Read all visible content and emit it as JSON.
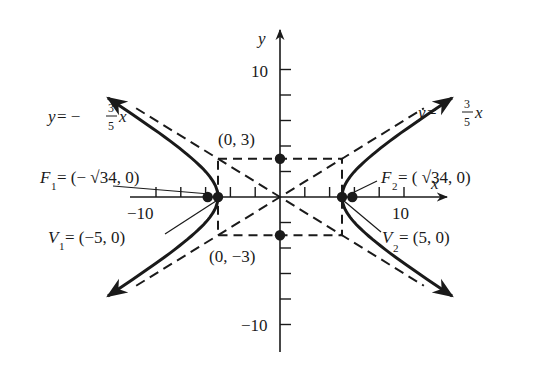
{
  "chart_data": {
    "type": "diagram",
    "xlabel": "x",
    "ylabel": "y",
    "xlim": [
      -12,
      12
    ],
    "ylim": [
      -12,
      12
    ],
    "x_tick_step": 2,
    "y_tick_step": 2,
    "x_tick_labels": [
      {
        "value": -10,
        "text": "−10"
      },
      {
        "value": 10,
        "text": "10"
      }
    ],
    "y_tick_labels": [
      {
        "value": 10,
        "text": "10"
      },
      {
        "value": -10,
        "text": "−10"
      }
    ],
    "hyperbola": {
      "a": 5,
      "b": 3,
      "center": [
        0,
        0
      ],
      "orientation": "horizontal"
    },
    "asymptotes": [
      {
        "slope": 0.6,
        "label": "y = 3/5 x"
      },
      {
        "slope": -0.6,
        "label": "y = −3/5 x"
      }
    ],
    "central_rectangle": {
      "x": [
        -5,
        5
      ],
      "y": [
        -3,
        3
      ]
    },
    "points": [
      {
        "name": "V1",
        "x": -5,
        "y": 0,
        "label": "V1 = (−5, 0)"
      },
      {
        "name": "V2",
        "x": 5,
        "y": 0,
        "label": "V2 = (5, 0)"
      },
      {
        "name": "F1",
        "x": -5.831,
        "y": 0,
        "label": "F1 = (−√34, 0)"
      },
      {
        "name": "F2",
        "x": 5.831,
        "y": 0,
        "label": "F2 = (√34, 0)"
      },
      {
        "name": "B1",
        "x": 0,
        "y": 3,
        "label": "(0, 3)"
      },
      {
        "name": "B2",
        "x": 0,
        "y": -3,
        "label": "(0, −3)"
      }
    ]
  },
  "labels": {
    "x_axis": "x",
    "y_axis": "y",
    "tick_y_pos10": "10",
    "tick_y_neg10": "−10",
    "tick_x_neg10": "−10",
    "tick_x_pos10": "10",
    "asym_left": {
      "y": "y",
      "eq": " = −",
      "num": "3",
      "den": "5",
      "x": "x"
    },
    "asym_right": {
      "y": "y",
      "eq": " = ",
      "num": "3",
      "den": "5",
      "x": "x"
    },
    "f1": {
      "name": "F",
      "sub": "1",
      "rest": " = (− √34, 0)"
    },
    "f2": {
      "name": "F",
      "sub": "2",
      "rest": " = ( √34, 0)"
    },
    "v1": {
      "name": "V",
      "sub": "1",
      "rest": " = (−5, 0)"
    },
    "v2": {
      "name": "V",
      "sub": "2",
      "rest": " = (5, 0)"
    },
    "b_top": "(0, 3)",
    "b_bottom": "(0, −3)"
  },
  "style": {
    "ink": "#1a1a1a",
    "background": "#ffffff"
  }
}
